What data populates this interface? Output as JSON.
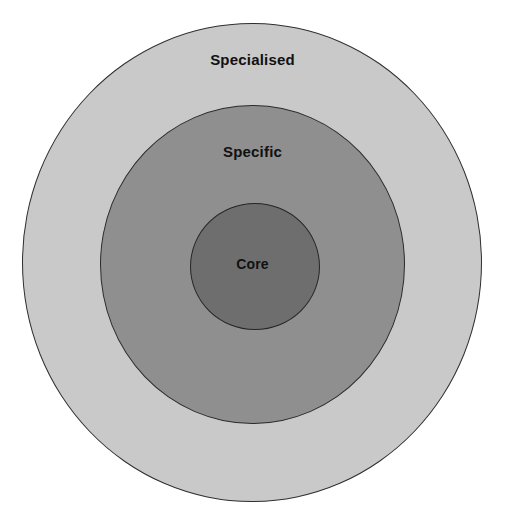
{
  "figure": {
    "type": "concentric-circles-diagram",
    "background_color": "#ffffff",
    "outline_color": "#2f2f2f",
    "rings": [
      {
        "id": "specialised",
        "label": "Specialised",
        "level": 3,
        "fill_color": "#c9c9c9",
        "diameter_px": 460
      },
      {
        "id": "specific",
        "label": "Specific",
        "level": 2,
        "fill_color": "#8f8f8f",
        "diameter_px": 305
      },
      {
        "id": "core",
        "label": "Core",
        "level": 1,
        "fill_color": "#6e6e6e",
        "diameter_px": 130
      }
    ]
  },
  "caption": {
    "clipped_text": ""
  }
}
